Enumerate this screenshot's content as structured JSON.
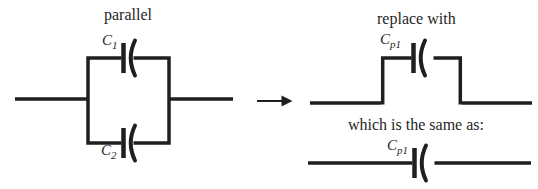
{
  "canvas": {
    "background": "#ffffff",
    "ink": "#1f1f1f"
  },
  "left_circuit": {
    "title": "parallel",
    "capacitor_labels": [
      {
        "symbol": "C",
        "sub": "1"
      },
      {
        "symbol": "C",
        "sub": "2"
      }
    ]
  },
  "arrow": {
    "icon": "right-arrow"
  },
  "replacement_circuit": {
    "title": "replace with",
    "capacitor_label": {
      "symbol": "C",
      "sub": "p1"
    }
  },
  "equivalent_circuit": {
    "title": "which is the same as:",
    "capacitor_label": {
      "symbol": "C",
      "sub": "p1"
    }
  }
}
